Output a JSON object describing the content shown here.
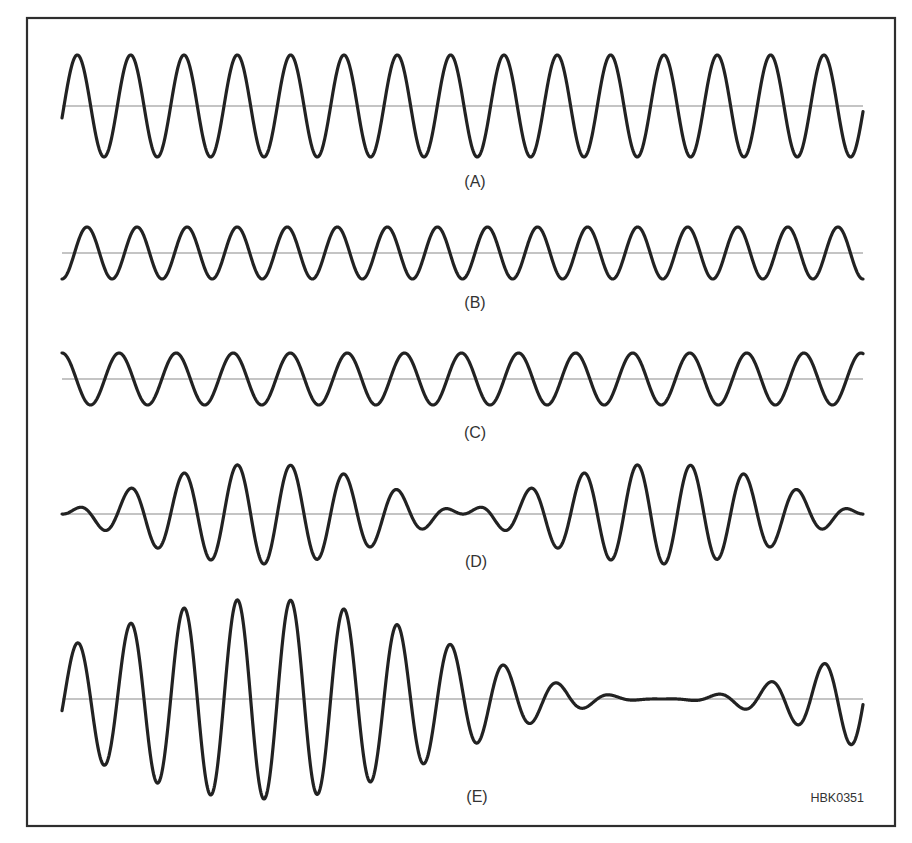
{
  "figure": {
    "figure_id": "HBK0351",
    "frame": {
      "x": 27,
      "y": 18,
      "width": 868,
      "height": 808,
      "color": "#2e2e2e"
    },
    "x_start": 62,
    "x_end": 863,
    "wave_color": "#222222",
    "baseline_color": "#8a8a8a",
    "panels": [
      {
        "id": "A",
        "label": "(A)",
        "baseline_y": 106,
        "label_y": 187,
        "description": "Constant-amplitude sine wave, about 15 cycles",
        "model": {
          "kind": "sine",
          "amplitude": 51,
          "period": 53.33,
          "phase_x": 64,
          "shape": "sin"
        }
      },
      {
        "id": "B",
        "label": "(B)",
        "baseline_y": 253,
        "label_y": 308,
        "description": "Lower-amplitude sine wave, slightly higher frequency, about 16 cycles",
        "model": {
          "kind": "sine",
          "amplitude": 26,
          "period": 50.06,
          "phase_x": 62,
          "shape": "negcos"
        }
      },
      {
        "id": "C",
        "label": "(C)",
        "baseline_y": 379,
        "label_y": 438,
        "description": "Lower-amplitude sine wave, slightly lower frequency, about 14 cycles",
        "model": {
          "kind": "sine",
          "amplitude": 26,
          "period": 57.07,
          "phase_x": 62,
          "shape": "cos"
        }
      },
      {
        "id": "D",
        "label": "(D)",
        "baseline_y": 514,
        "label_y": 567,
        "description": "Beat pattern: carrier with sinusoidal envelope, two lobes with nulls at ends and center",
        "model": {
          "kind": "beat",
          "amplitude": 50,
          "period": 53.33,
          "phase_x": 64,
          "envelope_period": 800,
          "envelope_offset": 0
        }
      },
      {
        "id": "E",
        "label": "(E)",
        "baseline_y": 699,
        "label_y": 802,
        "description": "Amplitude-modulated wave: envelope maximum on left, near-zero around x=662",
        "model": {
          "kind": "am",
          "amplitude": 50,
          "period": 53.33,
          "phase_x": 64,
          "envelope_period": 800,
          "envelope_offset": 1
        }
      }
    ]
  }
}
